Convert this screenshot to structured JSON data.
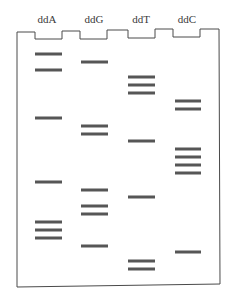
{
  "figure": {
    "type": "dna-sequencing-gel",
    "colors": {
      "band": "#565656",
      "outline": "#4a4a4a",
      "label": "#3a3a3a",
      "background": "#ffffff"
    }
  },
  "lanes": [
    {
      "label": "ddA",
      "x0": 35,
      "x1": 62,
      "label_x": 47,
      "bands_y": [
        54,
        70,
        118,
        182,
        222,
        230,
        238
      ]
    },
    {
      "label": "ddG",
      "x0": 81,
      "x1": 108,
      "label_x": 94,
      "bands_y": [
        62,
        126,
        134,
        190,
        206,
        214,
        246
      ]
    },
    {
      "label": "ddT",
      "x0": 128,
      "x1": 155,
      "label_x": 141,
      "bands_y": [
        77,
        85,
        93,
        141,
        197,
        261,
        269
      ]
    },
    {
      "label": "ddC",
      "x0": 175,
      "x1": 201,
      "label_x": 187,
      "bands_y": [
        101,
        109,
        149,
        157,
        165,
        173,
        252
      ]
    }
  ]
}
